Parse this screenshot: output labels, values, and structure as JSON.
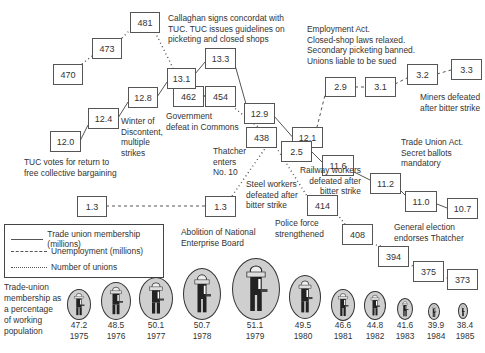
{
  "chart_data": {
    "type": "line",
    "title": "",
    "xlabel": "",
    "ylabel": "",
    "legend": [
      {
        "name": "Trade union membership (millions)",
        "style": "solid"
      },
      {
        "name": "Unemployment (millions)",
        "style": "dashed"
      },
      {
        "name": "Number of unions",
        "style": "dotted"
      }
    ],
    "x": [
      "1975",
      "1976",
      "1977",
      "1978",
      "1979",
      "1980",
      "1981",
      "1982",
      "1983",
      "1984",
      "1985"
    ],
    "series": [
      {
        "name": "Trade union membership (millions)",
        "values": [
          12.0,
          12.4,
          12.8,
          13.1,
          13.3,
          12.9,
          12.1,
          11.6,
          11.2,
          11.0,
          10.7
        ]
      },
      {
        "name": "Unemployment (millions)",
        "values": [
          1.3,
          1.3,
          1.3,
          1.3,
          1.3,
          2.5,
          2.9,
          3.1,
          3.2,
          3.3,
          3.3
        ]
      },
      {
        "name": "Number of unions",
        "values": [
          470,
          473,
          481,
          462,
          454,
          438,
          414,
          408,
          394,
          375,
          373
        ]
      }
    ],
    "membership_percentage": {
      "label": "Trade-union membership as a percentage of working population",
      "years": [
        "1975",
        "1976",
        "1977",
        "1978",
        "1979",
        "1980",
        "1981",
        "1982",
        "1983",
        "1984",
        "1985"
      ],
      "values": [
        47.2,
        48.5,
        50.1,
        50.7,
        51.1,
        49.5,
        46.6,
        44.8,
        41.6,
        39.9,
        38.4
      ]
    }
  },
  "boxes": {
    "unions": [
      "470",
      "473",
      "481",
      "462",
      "454",
      "438",
      "414",
      "408",
      "394",
      "375",
      "373"
    ],
    "membership": [
      "12.0",
      "12.4",
      "12.8",
      "13.1",
      "13.3",
      "12.9",
      "12.1",
      "11.6",
      "11.2",
      "11.0",
      "10.7"
    ],
    "unemployment": [
      "1.3",
      "1.3",
      "2.5",
      "2.9",
      "3.1",
      "3.2",
      "3.3"
    ]
  },
  "annotations": {
    "callaghan": "Callaghan signs concordat with\nTUC. TUC issues guidelines on\npicketing and closed shops",
    "employment_act": "Employment Act.\nClosed-shop laws relaxed.\nSecondary picketing banned.\nUnions liable to be sued",
    "miners": "Miners defeated\nafter bitter strike",
    "winter": "Winter of\nDiscontent,\nmultiple\nstrikes",
    "government_defeat": "Government\ndefeat in Commons",
    "tuc_votes": "TUC votes for return to\nfree collective bargaining",
    "thatcher": "Thatcher\nenters\nNo. 10",
    "trade_union_act": "Trade Union Act.\nSecret ballots\nmandatory",
    "railway": "Railway workers\ndefeated after\nbitter strike",
    "steel": "Steel workers\ndefeated after\nbitter strike",
    "police": "Police force\nstrengthened",
    "general_election": "General election\nendorses Thatcher",
    "abolition": "Abolition of National\nEnterprise Board"
  },
  "legend": {
    "membership": "Trade union membership (millions)",
    "unemployment": "Unemployment (millions)",
    "unions": "Number of unions"
  },
  "percentage_panel": {
    "title": "Trade-union\nmembership as\na percentage\nof working\npopulation",
    "items": [
      {
        "value": "47.2",
        "year": "1975"
      },
      {
        "value": "48.5",
        "year": "1976"
      },
      {
        "value": "50.1",
        "year": "1977"
      },
      {
        "value": "50.7",
        "year": "1978"
      },
      {
        "value": "51.1",
        "year": "1979"
      },
      {
        "value": "49.5",
        "year": "1980"
      },
      {
        "value": "46.6",
        "year": "1981"
      },
      {
        "value": "44.8",
        "year": "1982"
      },
      {
        "value": "41.6",
        "year": "1983"
      },
      {
        "value": "39.9",
        "year": "1984"
      },
      {
        "value": "38.4",
        "year": "1985"
      }
    ]
  },
  "colors": {
    "line": "#555555",
    "oval_fill": "#cfcfcf",
    "text": "#333333"
  }
}
